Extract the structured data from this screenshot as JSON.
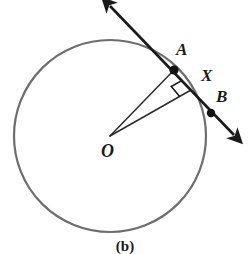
{
  "figure": {
    "caption": "(b)",
    "kind": "circle-with-secant-and-perpendicular-radius",
    "background_color": "#ffffff"
  },
  "colors": {
    "circle_stroke": "#6e6e6e",
    "line_stroke": "#1a1a1a",
    "radius_stroke": "#2b2b2b",
    "label_color": "#1a1a1a",
    "point_fill": "#111111",
    "right_angle_stroke": "#1a1a1a"
  },
  "circle": {
    "name": "circle-O",
    "center_x": 110,
    "center_y": 136,
    "radius": 96,
    "stroke_width": 2.2
  },
  "points": [
    {
      "id": "A",
      "label": "A",
      "x": 174,
      "y": 70,
      "dot": true,
      "dot_radius": 4.6
    },
    {
      "id": "X",
      "label": "X",
      "x": 191,
      "y": 90,
      "dot": false,
      "dot_radius": 0
    },
    {
      "id": "B",
      "label": "B",
      "x": 211,
      "y": 113,
      "dot": true,
      "dot_radius": 4.2
    },
    {
      "id": "O",
      "label": "O",
      "x": 110,
      "y": 136,
      "dot": false,
      "dot_radius": 0
    }
  ],
  "secant_line": {
    "name": "line-AB",
    "from_arrow_tip_x": 110,
    "from_arrow_tip_y": 6,
    "to_arrow_tip_x": 234,
    "to_arrow_tip_y": 135,
    "stroke_width": 2.6,
    "double_headed": true
  },
  "segments": [
    {
      "id": "OA",
      "name": "radius-OA",
      "x1": 110,
      "y1": 136,
      "x2": 174,
      "y2": 70,
      "stroke_width": 1.5
    },
    {
      "id": "OX",
      "name": "radius-OX",
      "x1": 110,
      "y1": 136,
      "x2": 191,
      "y2": 90,
      "stroke_width": 1.5
    }
  ],
  "right_angle": {
    "name": "right-angle-mark-at-X",
    "vertex_x": 191,
    "vertex_y": 90,
    "size": 13,
    "stroke_width": 1.6
  }
}
